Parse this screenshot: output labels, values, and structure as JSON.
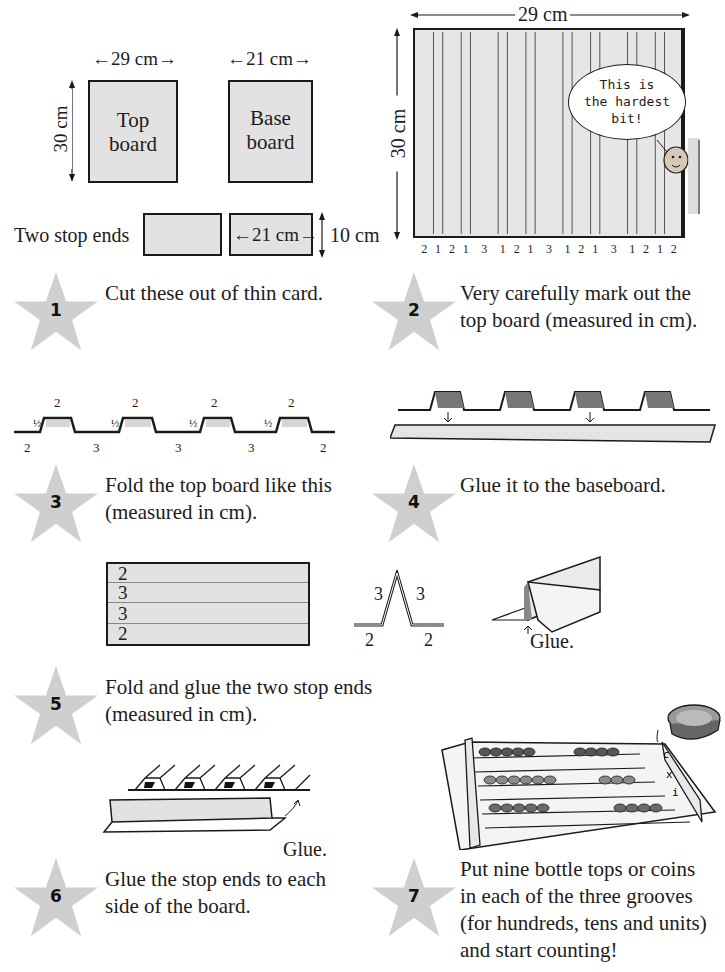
{
  "cut_diagram": {
    "top_board": {
      "label_line1": "Top",
      "label_line2": "board",
      "width": "29 cm",
      "height": "30 cm"
    },
    "base_board": {
      "label_line1": "Base",
      "label_line2": "board",
      "width": "21 cm"
    },
    "stop_ends": {
      "label": "Two stop ends",
      "width": "21 cm",
      "height": "10 cm"
    }
  },
  "marked_board": {
    "width": "29 cm",
    "height": "30 cm",
    "segments": [
      "2",
      "1",
      "2",
      "1",
      "3",
      "1",
      "2",
      "1",
      "3",
      "1",
      "2",
      "1",
      "3",
      "1",
      "2",
      "1",
      "2"
    ],
    "speech_bubble": {
      "line1": "This is",
      "line2": "the hardest",
      "line3": "bit!"
    }
  },
  "fold_profile": {
    "top_labels": [
      "2",
      "2",
      "2",
      "2"
    ],
    "half_labels": [
      "½",
      "½",
      "½",
      "½"
    ],
    "bottom_labels": [
      "2",
      "3",
      "3",
      "3",
      "2"
    ]
  },
  "stop_end_diagram": {
    "rows": [
      "2",
      "3",
      "3",
      "2"
    ],
    "profile_labels": {
      "left_up": "3",
      "right_up": "3",
      "left_base": "2",
      "right_base": "2"
    },
    "glue_label": "Glue."
  },
  "attach_diagram": {
    "glue_label": "Glue."
  },
  "steps": [
    {
      "number": "1",
      "line1": "Cut these out of thin card."
    },
    {
      "number": "2",
      "line1": "Very carefully mark out the",
      "line2": "top board (measured in cm)."
    },
    {
      "number": "3",
      "line1": "Fold the top board like this",
      "line2": "(measured in cm)."
    },
    {
      "number": "4",
      "line1": "Glue it to the baseboard."
    },
    {
      "number": "5",
      "line1": "Fold and glue the two stop ends",
      "line2": "(measured in cm)."
    },
    {
      "number": "6",
      "line1": "Glue the stop ends to each",
      "line2": "side of the board."
    },
    {
      "number": "7",
      "line1": "Put nine bottle tops or coins",
      "line2": "in each of the three grooves",
      "line3": "(for hundreds, tens and units)",
      "line4": "and start counting!"
    }
  ],
  "abacus_labels": {
    "hundreds": "c",
    "tens": "x",
    "units": "i"
  },
  "colors": {
    "star": "#cfcfcf",
    "card": "#e2e2e2",
    "ink": "#1a1a1a"
  }
}
